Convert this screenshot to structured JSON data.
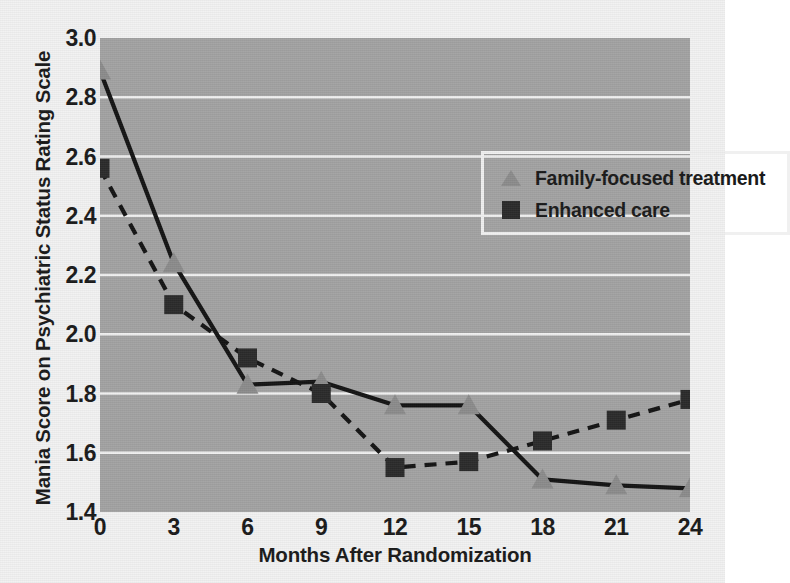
{
  "chart_data": {
    "type": "line",
    "title": "",
    "xlabel": "Months After Randomization",
    "ylabel": "Mania Score on Psychiatric Status Rating Scale",
    "x": [
      0,
      3,
      6,
      9,
      12,
      15,
      18,
      21,
      24
    ],
    "xticklabels": [
      "0",
      "3",
      "6",
      "9",
      "12",
      "15",
      "18",
      "21",
      "24"
    ],
    "yticklabels": [
      "3.0",
      "2.8",
      "2.6",
      "2.4",
      "2.2",
      "2.0",
      "1.8",
      "1.6",
      "1.4"
    ],
    "yticks": [
      3.0,
      2.8,
      2.6,
      2.4,
      2.2,
      2.0,
      1.8,
      1.6,
      1.4
    ],
    "xlim": [
      0,
      24
    ],
    "ylim": [
      1.4,
      3.0
    ],
    "grid": "horizontal",
    "grid_color": "#f0f0f0",
    "plot_background": "#a3a3a3",
    "figure_background": "#f2f2f2",
    "legend_position": "top-right",
    "series": [
      {
        "name": "Family-focused treatment",
        "marker": "triangle",
        "marker_color": "#8c8c8c",
        "line_color": "#141414",
        "line_style": "solid",
        "values": [
          2.89,
          2.24,
          1.83,
          1.84,
          1.76,
          1.76,
          1.51,
          1.49,
          1.48
        ]
      },
      {
        "name": "Enhanced care",
        "marker": "square",
        "marker_color": "#2b2b2b",
        "line_color": "#141414",
        "line_style": "dashed",
        "values": [
          2.56,
          2.1,
          1.92,
          1.8,
          1.55,
          1.57,
          1.64,
          1.71,
          1.78
        ]
      }
    ]
  },
  "legend": {
    "entries": [
      {
        "label": "Family-focused treatment"
      },
      {
        "label": "Enhanced care"
      }
    ]
  },
  "axes": {
    "x_title": "Months After Randomization",
    "y_title": "Mania Score on Psychiatric Status Rating Scale"
  }
}
